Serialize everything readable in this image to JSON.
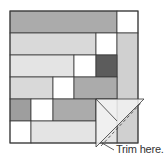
{
  "diagram": {
    "type": "quilt-block-illustration",
    "annotation": "Trim here.",
    "colors": {
      "white": "#ffffff",
      "light": "#e4e4e4",
      "light_striped": "#d9d9d9",
      "light_column": "#d0d0d0",
      "medium": "#ababab",
      "medium_dark": "#9e9e9e",
      "dark": "#5c5c5c",
      "outline": "#3a3a3a",
      "ruler": "#f0f0f0"
    },
    "pieces": [
      {
        "row": 1,
        "x": 10,
        "y": 11,
        "w": 107,
        "h": 22,
        "fill": "medium"
      },
      {
        "row": 1,
        "x": 117,
        "y": 11,
        "w": 21,
        "h": 22,
        "fill": "white"
      },
      {
        "row": 2,
        "x": 10,
        "y": 33,
        "w": 86,
        "h": 22,
        "fill": "light_striped"
      },
      {
        "row": 2,
        "x": 96,
        "y": 33,
        "w": 21,
        "h": 22,
        "fill": "white"
      },
      {
        "row": 2,
        "x": 117,
        "y": 33,
        "w": 21,
        "h": 110,
        "fill": "light_column"
      },
      {
        "row": 3,
        "x": 10,
        "y": 55,
        "w": 64,
        "h": 22,
        "fill": "light"
      },
      {
        "row": 3,
        "x": 74,
        "y": 55,
        "w": 22,
        "h": 22,
        "fill": "white"
      },
      {
        "row": 3,
        "x": 96,
        "y": 55,
        "w": 21,
        "h": 22,
        "fill": "dark"
      },
      {
        "row": 4,
        "x": 10,
        "y": 77,
        "w": 43,
        "h": 22,
        "fill": "light_striped"
      },
      {
        "row": 4,
        "x": 53,
        "y": 77,
        "w": 21,
        "h": 22,
        "fill": "white"
      },
      {
        "row": 4,
        "x": 74,
        "y": 77,
        "w": 43,
        "h": 22,
        "fill": "medium"
      },
      {
        "row": 5,
        "x": 10,
        "y": 99,
        "w": 21,
        "h": 22,
        "fill": "medium_dark"
      },
      {
        "row": 5,
        "x": 31,
        "y": 99,
        "w": 22,
        "h": 22,
        "fill": "white"
      },
      {
        "row": 5,
        "x": 53,
        "y": 99,
        "w": 43,
        "h": 22,
        "fill": "medium"
      },
      {
        "row": 5,
        "x": 96,
        "y": 99,
        "w": 21,
        "h": 44,
        "fill": "light"
      },
      {
        "row": 6,
        "x": 10,
        "y": 121,
        "w": 21,
        "h": 22,
        "fill": "white"
      },
      {
        "row": 6,
        "x": 31,
        "y": 121,
        "w": 65,
        "h": 22,
        "fill": "light"
      }
    ]
  }
}
